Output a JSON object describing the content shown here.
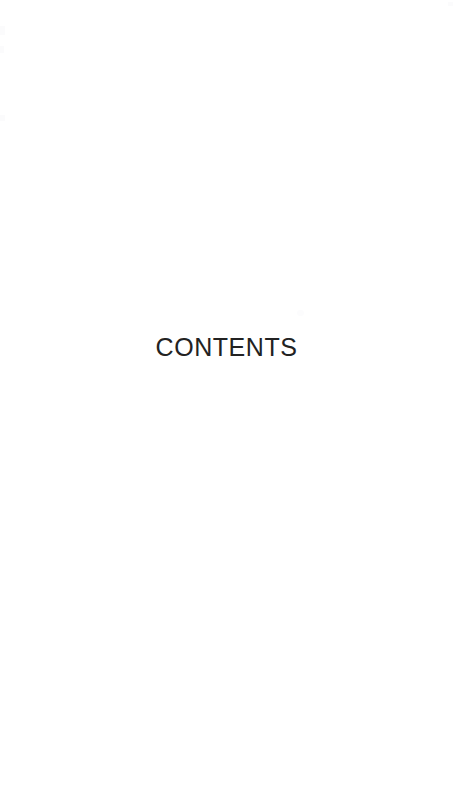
{
  "page": {
    "kind": "book-front-matter-section-divider",
    "background_color": "#ffffff",
    "width": 453,
    "height": 792
  },
  "heading": {
    "text": "CONTENTS",
    "color": "#222222",
    "alignment": "center"
  },
  "artifacts": {
    "description": "faint scanner speckles",
    "color": "#fbfbfc"
  }
}
